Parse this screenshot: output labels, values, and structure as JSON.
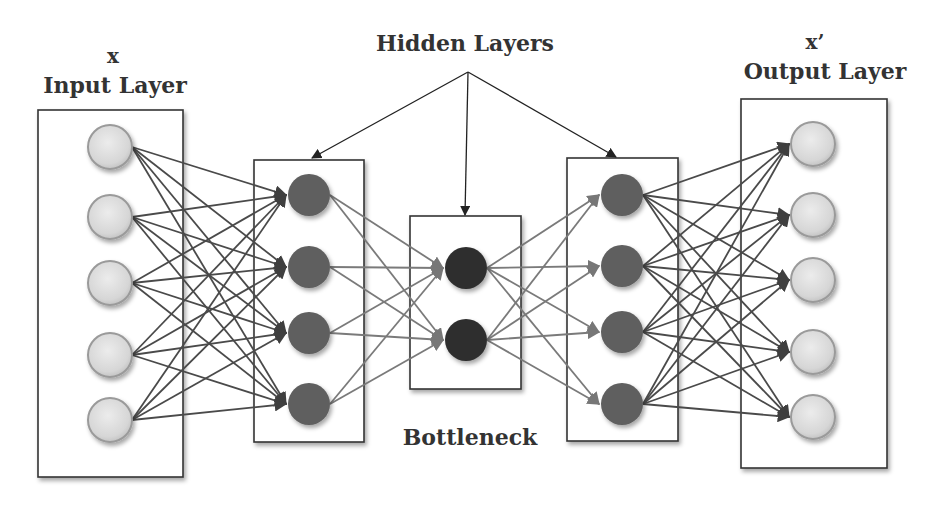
{
  "labels": {
    "input_symbol": "x",
    "input_title": "Input Layer",
    "hidden_title": "Hidden Layers",
    "output_symbol": "x’",
    "output_title": "Output Layer",
    "bottleneck_title": "Bottleneck"
  },
  "colors": {
    "io_node_fill": "#dcdcdc",
    "io_node_stroke": "#9a9a9a",
    "hidden_node_fill": "#5e5e5e",
    "bottleneck_node_fill": "#2f2f2f",
    "edge_dark": "#4a4a4a",
    "edge_light": "#7a7a7a",
    "box_stroke": "#333333"
  },
  "layers": [
    {
      "name": "input",
      "node_count": 5
    },
    {
      "name": "hidden-1",
      "node_count": 4
    },
    {
      "name": "bottleneck",
      "node_count": 2
    },
    {
      "name": "hidden-2",
      "node_count": 4
    },
    {
      "name": "output",
      "node_count": 5
    }
  ]
}
